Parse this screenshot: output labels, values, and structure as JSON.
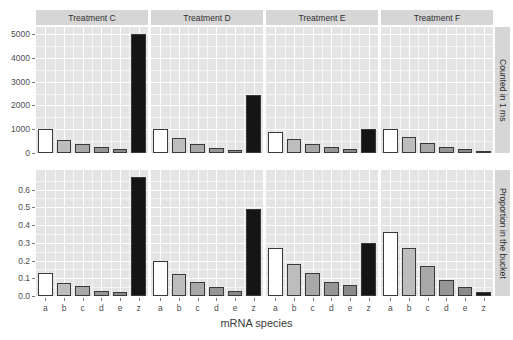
{
  "chart_data": {
    "type": "bar",
    "title": "",
    "xlabel": "mRNA species",
    "ylabel": "",
    "grid": true,
    "legend": false,
    "categories": [
      "a",
      "b",
      "c",
      "d",
      "e",
      "z"
    ],
    "col_facets": [
      "Treatment C",
      "Treatment D",
      "Treatment E",
      "Treatment F"
    ],
    "row_facets": [
      "Counted in 1 ms",
      "Proportion in the bucket"
    ],
    "rows": [
      {
        "facet": "Counted in 1 ms",
        "ylim": [
          0,
          5300
        ],
        "yticks": [
          0,
          1000,
          2000,
          3000,
          4000,
          5000
        ],
        "ytick_labels": [
          "0",
          "1000",
          "2000",
          "3000",
          "4000",
          "5000"
        ],
        "panels": [
          {
            "facet": "Treatment C",
            "values": [
              1000,
              550,
              400,
              250,
              150,
              5000
            ]
          },
          {
            "facet": "Treatment D",
            "values": [
              1000,
              620,
              380,
              230,
              140,
              2450
            ]
          },
          {
            "facet": "Treatment E",
            "values": [
              900,
              600,
              400,
              250,
              180,
              1000
            ]
          },
          {
            "facet": "Treatment F",
            "values": [
              1000,
              680,
              420,
              260,
              150,
              100
            ]
          }
        ]
      },
      {
        "facet": "Proportion in the bucket",
        "ylim": [
          0,
          0.71
        ],
        "yticks": [
          0.0,
          0.1,
          0.2,
          0.3,
          0.4,
          0.5,
          0.6
        ],
        "ytick_labels": [
          "0.0",
          "0.1",
          "0.2",
          "0.3",
          "0.4",
          "0.5",
          "0.6"
        ],
        "panels": [
          {
            "facet": "Treatment C",
            "values": [
              0.13,
              0.075,
              0.055,
              0.03,
              0.02,
              0.67
            ]
          },
          {
            "facet": "Treatment D",
            "values": [
              0.2,
              0.125,
              0.08,
              0.05,
              0.03,
              0.49
            ]
          },
          {
            "facet": "Treatment E",
            "values": [
              0.27,
              0.18,
              0.13,
              0.08,
              0.06,
              0.3
            ]
          },
          {
            "facet": "Treatment F",
            "values": [
              0.36,
              0.27,
              0.17,
              0.09,
              0.05,
              0.025
            ]
          }
        ]
      }
    ],
    "bar_fills": [
      "#ffffff",
      "#bdbdbd",
      "#a8a8a8",
      "#969696",
      "#8a8a8a",
      "#151515"
    ],
    "colors": {
      "panel_background": "#e4e4e4",
      "grid": "#ffffff",
      "strip_background": "#d6d6d6",
      "bar_outline": "#3a3a3a",
      "text": "#3c3c3c"
    }
  }
}
